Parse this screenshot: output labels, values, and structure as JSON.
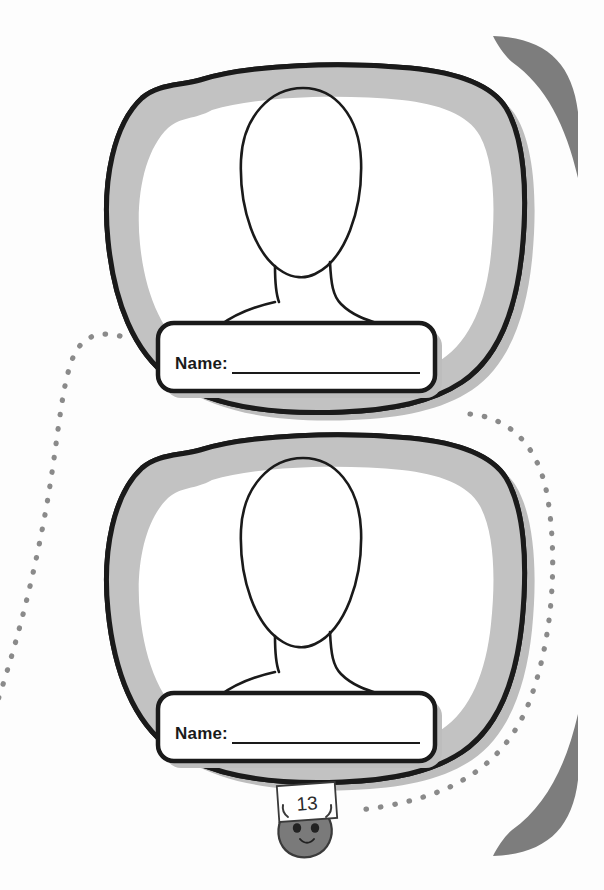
{
  "page": {
    "width": 604,
    "height": 890,
    "background_color": "#fdfdfd",
    "page_number": "13"
  },
  "colors": {
    "outline": "#1a1a1a",
    "inner_band_gray": "#c2c2c2",
    "shadow_gray": "#bdbdbd",
    "corner_swoosh_gray": "#7d7d7d",
    "dotted_path_gray": "#8a8a8a",
    "mascot_body_gray": "#7a7a7a",
    "mascot_outline": "#3a3a3a",
    "card_white": "#ffffff"
  },
  "portraits": [
    {
      "id": "portrait-frame-1",
      "name_label": "Name:",
      "name_value": "",
      "name_line": true
    },
    {
      "id": "portrait-frame-2",
      "name_label": "Name:",
      "name_value": "",
      "name_line": true
    }
  ],
  "decorations": {
    "corner_top_right": "corner-swoosh-icon",
    "corner_bottom_right": "corner-swoosh-icon",
    "dotted_path_left": "dotted-path-decoration",
    "dotted_path_right": "dotted-path-decoration",
    "mascot": "pebble-mascot-icon"
  },
  "mascot": {
    "label": "13",
    "expression": "smiling"
  }
}
